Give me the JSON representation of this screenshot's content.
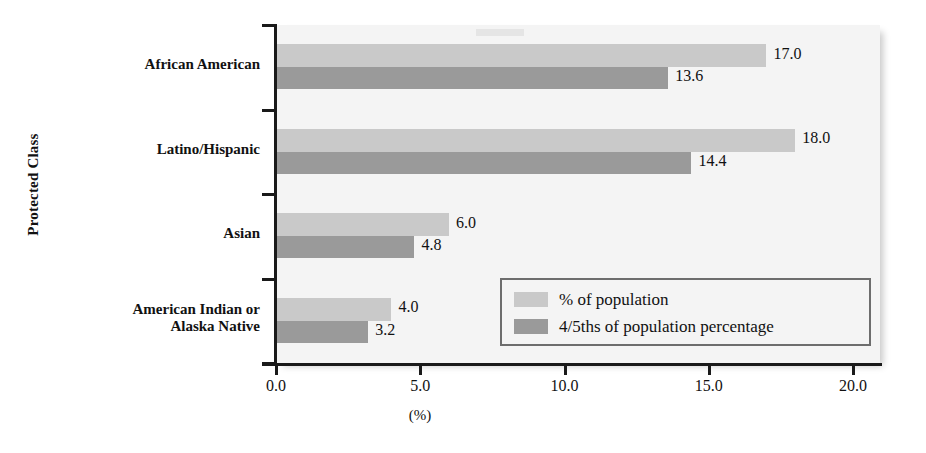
{
  "chart_data": {
    "type": "bar",
    "orientation": "horizontal",
    "title": "",
    "xlabel": "(%)",
    "ylabel": "Protected Class",
    "xlim": [
      0.0,
      21.0
    ],
    "xticks": [
      "0.0",
      "5.0",
      "10.0",
      "15.0",
      "20.0"
    ],
    "xtick_values": [
      0.0,
      5.0,
      10.0,
      15.0,
      20.0
    ],
    "grid": false,
    "legend_position": "inside-bottom-right",
    "categories": [
      "African American",
      "Latino/Hispanic",
      "Asian",
      "American Indian or\nAlaska Native"
    ],
    "series": [
      {
        "name": "% of population",
        "color": "#c9c9c9",
        "values": [
          17.0,
          18.0,
          6.0,
          4.0
        ],
        "labels": [
          "17.0",
          "18.0",
          "6.0",
          "4.0"
        ]
      },
      {
        "name": "4/5ths of population percentage",
        "color": "#9a9a9a",
        "values": [
          13.6,
          14.4,
          4.8,
          3.2
        ],
        "labels": [
          "13.6",
          "14.4",
          "4.8",
          "3.2"
        ]
      }
    ]
  },
  "axes": {
    "y_title": "Protected Class",
    "x_title": "(%)"
  },
  "legend": {
    "entries": [
      {
        "label": "% of population",
        "swatch": "light"
      },
      {
        "label": "4/5ths of population percentage",
        "swatch": "dark"
      }
    ]
  },
  "colors": {
    "series_light": "#c9c9c9",
    "series_dark": "#9a9a9a",
    "plot_background": "#f4f4f4",
    "axis": "#1a1a1a",
    "text": "#111111",
    "legend_border": "#6d6d6d"
  }
}
